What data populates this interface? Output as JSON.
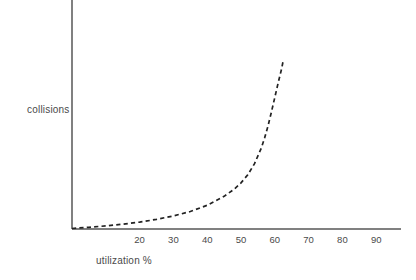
{
  "chart_data": {
    "type": "line",
    "title": "",
    "xlabel": "utilization %",
    "ylabel": "collisions",
    "xlim": [
      0,
      100
    ],
    "ylim": [
      0,
      100
    ],
    "grid": false,
    "legend": null,
    "xticklabels": [
      "20",
      "30",
      "40",
      "50",
      "60",
      "70",
      "80",
      "90"
    ],
    "xticks": [
      20,
      30,
      40,
      50,
      60,
      70,
      80,
      90
    ],
    "yticklabels": [],
    "yticks": [],
    "series": [
      {
        "name": "collisions vs utilization",
        "style": "dashed",
        "color": "#222222",
        "x": [
          0,
          5,
          10,
          15,
          20,
          25,
          30,
          35,
          40,
          45,
          48,
          50,
          52,
          54,
          56,
          57,
          58,
          59,
          60,
          61,
          62,
          62.5
        ],
        "y": [
          0.3,
          1.0,
          1.8,
          2.8,
          4.0,
          5.6,
          7.6,
          10.2,
          13.8,
          19.0,
          23.2,
          26.8,
          31.5,
          38.0,
          47.0,
          53.0,
          60.0,
          68.0,
          76.5,
          85.0,
          93.0,
          98.0
        ]
      }
    ]
  },
  "axes": {
    "y_axis_name": "vertical-axis-line",
    "x_axis_name": "horizontal-axis-line",
    "axis_color": "#808080"
  }
}
